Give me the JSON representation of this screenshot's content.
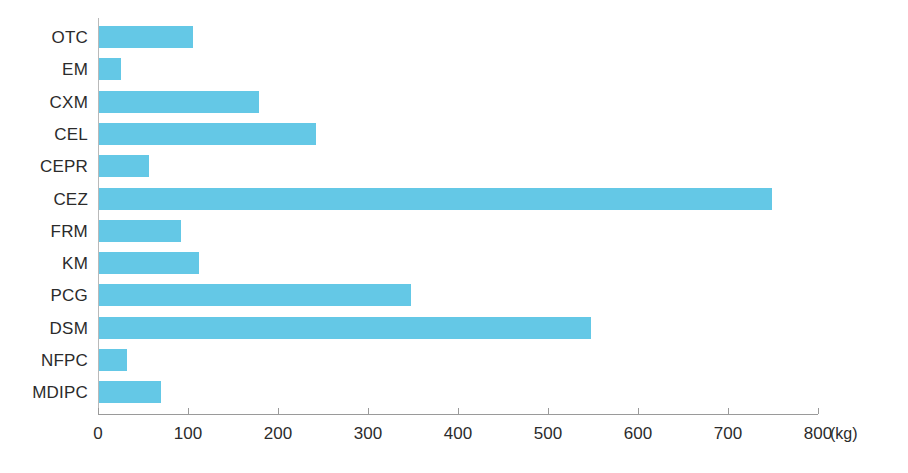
{
  "chart_data": {
    "type": "bar",
    "orientation": "horizontal",
    "title": "",
    "subtitle": "",
    "xlabel": "",
    "ylabel": "",
    "unit_label": "(kg)",
    "xlim": [
      0,
      800
    ],
    "xticks": [
      0,
      100,
      200,
      300,
      400,
      500,
      600,
      700,
      800
    ],
    "xtick_labels": [
      "0",
      "100",
      "200",
      "300",
      "400",
      "500",
      "600",
      "700",
      "800"
    ],
    "grid": false,
    "legend": false,
    "legend_position": "none",
    "bar_color": "#64c8e6",
    "axis_color": "#9a9a9a",
    "label_color": "#2b2b2b",
    "categories": [
      "OTC",
      "EM",
      "CXM",
      "CEL",
      "CEPR",
      "CEZ",
      "FRM",
      "KM",
      "PCG",
      "DSM",
      "NFPC",
      "MDIPC"
    ],
    "values": [
      104,
      24,
      178,
      241,
      55,
      748,
      91,
      111,
      347,
      547,
      31,
      69
    ],
    "bars": [
      {
        "category": "OTC",
        "value": 104
      },
      {
        "category": "EM",
        "value": 24
      },
      {
        "category": "CXM",
        "value": 178
      },
      {
        "category": "CEL",
        "value": 241
      },
      {
        "category": "CEPR",
        "value": 55
      },
      {
        "category": "CEZ",
        "value": 748
      },
      {
        "category": "FRM",
        "value": 91
      },
      {
        "category": "KM",
        "value": 111
      },
      {
        "category": "PCG",
        "value": 347
      },
      {
        "category": "DSM",
        "value": 547
      },
      {
        "category": "NFPC",
        "value": 31
      },
      {
        "category": "MDIPC",
        "value": 69
      }
    ]
  }
}
